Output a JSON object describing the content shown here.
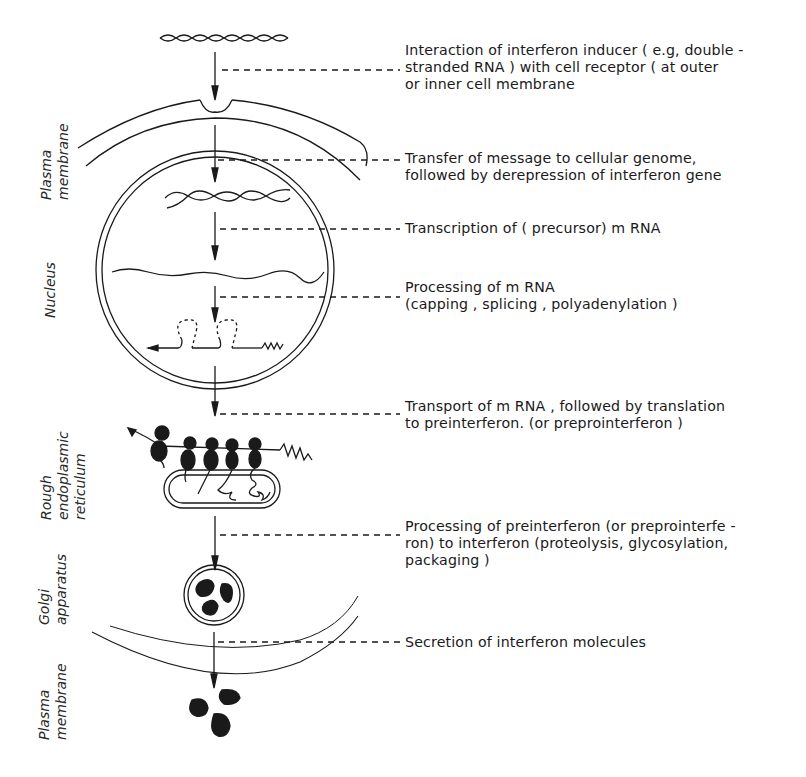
{
  "diagram": {
    "type": "biological-process-flow",
    "colors": {
      "ink": "#1a1a1a",
      "background": "#ffffff"
    },
    "compartments": [
      {
        "id": "plasma-membrane-top",
        "label_lines": [
          "Plasma",
          "membrane"
        ]
      },
      {
        "id": "nucleus",
        "label_lines": [
          "Nucleus"
        ]
      },
      {
        "id": "rough-er",
        "label_lines": [
          "Rough",
          "endoplasmic",
          "reticulum"
        ]
      },
      {
        "id": "golgi",
        "label_lines": [
          "Golgi",
          "apparatus"
        ]
      },
      {
        "id": "plasma-membrane-bottom",
        "label_lines": [
          "Plasma",
          "membrane"
        ]
      }
    ],
    "steps": [
      {
        "id": "step-1",
        "lines": [
          "Interaction of interferon inducer ( e.g, double -",
          "stranded RNA ) with cell receptor ( at outer",
          "or inner cell membrane"
        ]
      },
      {
        "id": "step-2",
        "lines": [
          "Transfer of message to cellular genome,",
          "followed by derepression of interferon gene"
        ]
      },
      {
        "id": "step-3",
        "lines": [
          "Transcription of ( precursor) m RNA"
        ]
      },
      {
        "id": "step-4",
        "lines": [
          "Processing of m RNA",
          " (capping , splicing , polyadenylation )"
        ]
      },
      {
        "id": "step-5",
        "lines": [
          "Transport of m RNA , followed by translation",
          "to preinterferon. (or preprointerferon )"
        ]
      },
      {
        "id": "step-6",
        "lines": [
          "Processing of preinterferon (or preprointerfe -",
          "ron) to interferon (proteolysis, glycosylation,",
          " packaging )"
        ]
      },
      {
        "id": "step-7",
        "lines": [
          "Secretion of interferon molecules"
        ]
      }
    ],
    "structures": [
      {
        "id": "ds-rna-inducer",
        "depiction": "double-helix"
      },
      {
        "id": "receptor-notch",
        "depiction": "membrane indentation"
      },
      {
        "id": "interferon-gene",
        "depiction": "double-helix in nucleus"
      },
      {
        "id": "precursor-mrna",
        "depiction": "wavy strand"
      },
      {
        "id": "processed-mrna",
        "depiction": "strand with spliced loops, cap arrow and poly-A tail"
      },
      {
        "id": "polysome",
        "depiction": "ribosomes on mRNA with nascent chains"
      },
      {
        "id": "er-cisterna",
        "depiction": "double-walled capsule"
      },
      {
        "id": "golgi-vesicle",
        "depiction": "double-ring vesicle with dark granules"
      },
      {
        "id": "secreted-interferon",
        "depiction": "three dark blobs"
      }
    ]
  }
}
